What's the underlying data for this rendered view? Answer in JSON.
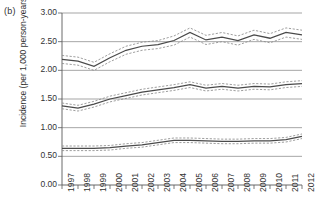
{
  "panel": {
    "label": "(b)"
  },
  "axes": {
    "ylabel": "Incidence (per 1,000 person-years)",
    "xlabel": "",
    "yticks": [
      "0.00",
      "0.50",
      "1.00",
      "1.50",
      "2.00",
      "2.50",
      "3.00"
    ],
    "xticks": [
      "1997",
      "1998",
      "1999",
      "2000",
      "2001",
      "2002",
      "2003",
      "2004",
      "2005",
      "2006",
      "2007",
      "2008",
      "2009",
      "2010",
      "2011",
      "2012"
    ]
  },
  "colors": {
    "line": "#4a4a4a",
    "ci": "#8d8d8d",
    "grid": "#808080",
    "axis": "#5a5a5a",
    "text": "#333333"
  },
  "chart_data": {
    "type": "line",
    "title": "",
    "subtitle": "",
    "xlabel": "",
    "ylabel": "Incidence (per 1,000 person-years)",
    "xlim": [
      1997,
      2012
    ],
    "ylim": [
      0.0,
      3.0
    ],
    "grid": true,
    "legend": "none",
    "annotations": [
      "(b)"
    ],
    "x": [
      1997,
      1998,
      1999,
      2000,
      2001,
      2002,
      2003,
      2004,
      2005,
      2006,
      2007,
      2008,
      2009,
      2010,
      2011,
      2012
    ],
    "series": [
      {
        "name": "Upper series (point estimate)",
        "values": [
          2.19,
          2.16,
          2.07,
          2.22,
          2.35,
          2.42,
          2.45,
          2.52,
          2.66,
          2.53,
          2.58,
          2.52,
          2.62,
          2.56,
          2.66,
          2.62
        ],
        "ci_lower": [
          2.12,
          2.09,
          2.0,
          2.15,
          2.28,
          2.35,
          2.38,
          2.44,
          2.58,
          2.45,
          2.5,
          2.44,
          2.54,
          2.48,
          2.58,
          2.54
        ],
        "ci_upper": [
          2.26,
          2.23,
          2.14,
          2.29,
          2.42,
          2.49,
          2.52,
          2.6,
          2.74,
          2.61,
          2.66,
          2.6,
          2.7,
          2.64,
          2.74,
          2.7
        ]
      },
      {
        "name": "Middle series (point estimate)",
        "values": [
          1.38,
          1.34,
          1.41,
          1.5,
          1.56,
          1.62,
          1.66,
          1.7,
          1.75,
          1.69,
          1.72,
          1.69,
          1.72,
          1.71,
          1.75,
          1.77
        ],
        "ci_lower": [
          1.33,
          1.29,
          1.36,
          1.45,
          1.51,
          1.57,
          1.61,
          1.65,
          1.7,
          1.64,
          1.67,
          1.64,
          1.67,
          1.66,
          1.7,
          1.72
        ],
        "ci_upper": [
          1.43,
          1.39,
          1.46,
          1.55,
          1.61,
          1.67,
          1.71,
          1.75,
          1.8,
          1.74,
          1.77,
          1.74,
          1.77,
          1.76,
          1.8,
          1.82
        ]
      },
      {
        "name": "Lower series (point estimate)",
        "values": [
          0.64,
          0.64,
          0.64,
          0.65,
          0.68,
          0.7,
          0.74,
          0.78,
          0.78,
          0.77,
          0.76,
          0.76,
          0.77,
          0.77,
          0.79,
          0.85
        ],
        "ci_lower": [
          0.6,
          0.6,
          0.6,
          0.61,
          0.64,
          0.66,
          0.7,
          0.74,
          0.74,
          0.73,
          0.72,
          0.72,
          0.73,
          0.73,
          0.75,
          0.81
        ],
        "ci_upper": [
          0.68,
          0.68,
          0.68,
          0.69,
          0.72,
          0.74,
          0.78,
          0.82,
          0.82,
          0.81,
          0.8,
          0.8,
          0.81,
          0.81,
          0.83,
          0.89
        ]
      }
    ]
  }
}
